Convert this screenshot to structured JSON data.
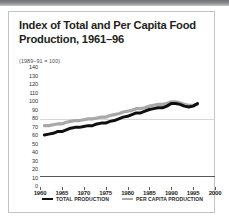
{
  "card": {
    "title": "Index of Total and Per Capita Food Production, 1961–96",
    "subtitle": "(1989–91 = 100)"
  },
  "legend": {
    "items": [
      {
        "label": "TOTAL PRODUCTION",
        "color": "#0f0f0f",
        "swatch": "legend-swatch-total"
      },
      {
        "label": "PER CAPITA PRODUCTION",
        "color": "#a7a8aa",
        "swatch": "legend-swatch-percapita"
      }
    ]
  },
  "chart_data": {
    "type": "line",
    "title": "Index of Total and Per Capita Food Production, 1961–96",
    "subtitle": "(1989–91 = 100)",
    "xlabel": "",
    "ylabel": "",
    "xlim": [
      1960,
      2000
    ],
    "ylim": [
      0,
      140
    ],
    "xticks": [
      1960,
      1965,
      1970,
      1975,
      1980,
      1985,
      1990,
      1995,
      2000
    ],
    "yticks": [
      0,
      10,
      20,
      30,
      40,
      50,
      60,
      70,
      80,
      90,
      100,
      110,
      120,
      130,
      140
    ],
    "grid": "horizontal-single-at-100",
    "legend_position": "bottom",
    "x": [
      1961,
      1962,
      1963,
      1964,
      1965,
      1966,
      1967,
      1968,
      1969,
      1970,
      1971,
      1972,
      1973,
      1974,
      1975,
      1976,
      1977,
      1978,
      1979,
      1980,
      1981,
      1982,
      1983,
      1984,
      1985,
      1986,
      1987,
      1988,
      1989,
      1990,
      1991,
      1992,
      1993,
      1994,
      1995,
      1996
    ],
    "series": [
      {
        "name": "TOTAL PRODUCTION",
        "color": "#0f0f0f",
        "values": [
          60,
          61,
          62,
          64,
          64,
          66,
          68,
          69,
          69,
          70,
          71,
          71,
          73,
          74,
          74,
          76,
          77,
          79,
          81,
          82,
          84,
          86,
          86,
          88,
          90,
          91,
          92,
          92,
          94,
          97,
          97,
          96,
          94,
          93,
          94,
          97
        ]
      },
      {
        "name": "PER CAPITA PRODUCTION",
        "color": "#a7a8aa",
        "values": [
          71,
          71,
          72,
          73,
          73,
          75,
          76,
          77,
          77,
          78,
          79,
          79,
          80,
          81,
          81,
          83,
          84,
          85,
          87,
          88,
          89,
          91,
          91,
          92,
          94,
          95,
          96,
          96,
          97,
          99,
          99,
          98,
          96,
          95,
          95,
          96
        ]
      }
    ]
  }
}
